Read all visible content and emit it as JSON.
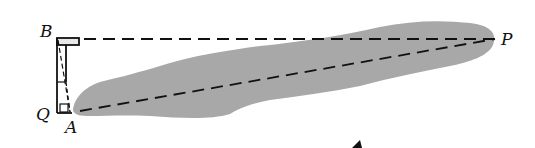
{
  "diagram": {
    "points": [
      {
        "id": "B",
        "label": "B",
        "x": 56,
        "y": 38
      },
      {
        "id": "Q",
        "label": "Q",
        "x": 58,
        "y": 113
      },
      {
        "id": "A",
        "label": "A",
        "x": 73,
        "y": 113
      },
      {
        "id": "P",
        "label": "P",
        "x": 495,
        "y": 38
      }
    ],
    "lines": [
      {
        "from": "B",
        "to": "P",
        "style": "dashed"
      },
      {
        "from": "A",
        "to": "P",
        "style": "dashed"
      }
    ],
    "colors": {
      "region_fill": "#a8a8a8",
      "line": "#111111",
      "background": "#ffffff"
    }
  }
}
